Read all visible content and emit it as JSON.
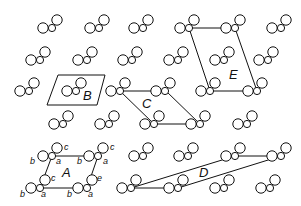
{
  "diagram": {
    "type": "crystal-lattice-unit-cells",
    "stroke_color": "#111111",
    "background": "#ffffff",
    "molecule_offsets": {
      "b": {
        "dx": -9,
        "dy": 0,
        "r": 5.2
      },
      "a": {
        "dx": 0,
        "dy": 0,
        "r": 3.6
      },
      "c": {
        "dx": 5,
        "dy": -8,
        "r": 5.2
      }
    },
    "molecules": [
      [
        52,
        28
      ],
      [
        99,
        28
      ],
      [
        143,
        28
      ],
      [
        189,
        28
      ],
      [
        235,
        28
      ],
      [
        281,
        28
      ],
      [
        40,
        60
      ],
      [
        87,
        60
      ],
      [
        132,
        60
      ],
      [
        178,
        60
      ],
      [
        224,
        60
      ],
      [
        268,
        60
      ],
      [
        29,
        91
      ],
      [
        76,
        91
      ],
      [
        120,
        91
      ],
      [
        165,
        91
      ],
      [
        210,
        91
      ],
      [
        257,
        91
      ],
      [
        63,
        124
      ],
      [
        109,
        124
      ],
      [
        154,
        124
      ],
      [
        200,
        124
      ],
      [
        247,
        124
      ],
      [
        52,
        156
      ],
      [
        98,
        156
      ],
      [
        143,
        156
      ],
      [
        188,
        156
      ],
      [
        235,
        156
      ],
      [
        281,
        156
      ],
      [
        40,
        188
      ],
      [
        87,
        188
      ],
      [
        131,
        188
      ],
      [
        178,
        188
      ],
      [
        224,
        188
      ],
      [
        270,
        188
      ]
    ],
    "cells": [
      {
        "label": "A",
        "points": [
          [
            52,
            156
          ],
          [
            98,
            156
          ],
          [
            87,
            188
          ],
          [
            40,
            188
          ]
        ],
        "label_pos": [
          62,
          177
        ]
      },
      {
        "label": "B",
        "points": [
          [
            58,
            75
          ],
          [
            105,
            75
          ],
          [
            97,
            105
          ],
          [
            47,
            105
          ]
        ],
        "label_pos": [
          83,
          100
        ]
      },
      {
        "label": "C",
        "points": [
          [
            120,
            91
          ],
          [
            166,
            91
          ],
          [
            200,
            124
          ],
          [
            154,
            124
          ]
        ],
        "label_pos": [
          142,
          108
        ]
      },
      {
        "label": "D",
        "points": [
          [
            131,
            188
          ],
          [
            178,
            188
          ],
          [
            281,
            156
          ],
          [
            235,
            156
          ]
        ],
        "label_pos": [
          199,
          177
        ]
      },
      {
        "label": "E",
        "points": [
          [
            189,
            28
          ],
          [
            235,
            28
          ],
          [
            257,
            91
          ],
          [
            210,
            91
          ]
        ],
        "label_pos": [
          229,
          79
        ]
      }
    ],
    "atom_labels": [
      {
        "text": "c",
        "pos": [
          64,
          150
        ]
      },
      {
        "text": "a",
        "pos": [
          56,
          164
        ]
      },
      {
        "text": "b",
        "pos": [
          30,
          164
        ]
      },
      {
        "text": "c",
        "pos": [
          110,
          150
        ]
      },
      {
        "text": "a",
        "pos": [
          103,
          164
        ]
      },
      {
        "text": "b",
        "pos": [
          77,
          164
        ]
      },
      {
        "text": "c",
        "pos": [
          51,
          181
        ]
      },
      {
        "text": "e",
        "pos": [
          97,
          181
        ]
      },
      {
        "text": "b",
        "pos": [
          20,
          197
        ]
      },
      {
        "text": "a",
        "pos": [
          41,
          197
        ]
      },
      {
        "text": "b",
        "pos": [
          67,
          197
        ]
      },
      {
        "text": "a",
        "pos": [
          88,
          197
        ]
      }
    ]
  }
}
